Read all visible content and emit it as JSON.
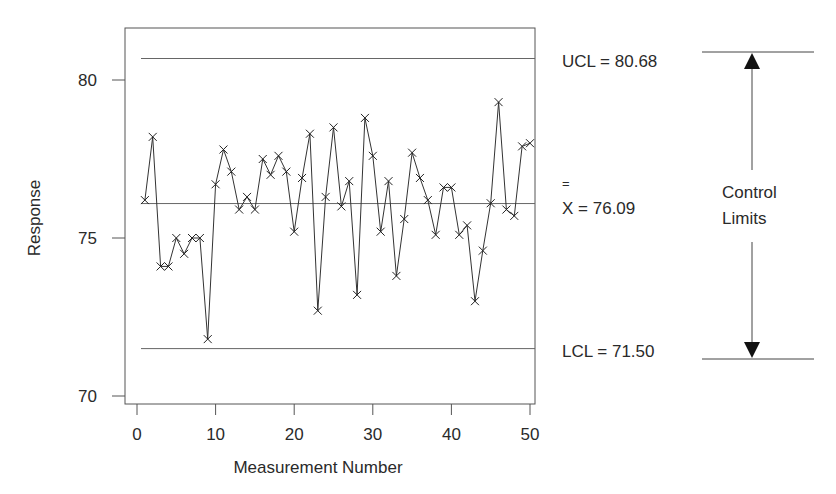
{
  "chart_data": {
    "type": "line",
    "title": "",
    "xlabel": "Measurement Number",
    "ylabel": "Response",
    "xlim": [
      0,
      50
    ],
    "ylim": [
      70,
      81.5
    ],
    "x_ticks": [
      0,
      10,
      20,
      30,
      40,
      50
    ],
    "y_ticks": [
      70,
      75,
      80
    ],
    "grid": false,
    "marker": "x",
    "x": [
      1,
      2,
      3,
      4,
      5,
      6,
      7,
      8,
      9,
      10,
      11,
      12,
      13,
      14,
      15,
      16,
      17,
      18,
      19,
      20,
      21,
      22,
      23,
      24,
      25,
      26,
      27,
      28,
      29,
      30,
      31,
      32,
      33,
      34,
      35,
      36,
      37,
      38,
      39,
      40,
      41,
      42,
      43,
      44,
      45,
      46,
      47,
      48,
      49,
      50
    ],
    "values": [
      76.2,
      78.2,
      74.1,
      74.1,
      75.0,
      74.5,
      75.0,
      75.0,
      71.8,
      76.7,
      77.8,
      77.1,
      75.9,
      76.3,
      75.9,
      77.5,
      77.0,
      77.6,
      77.1,
      75.2,
      76.9,
      78.3,
      72.7,
      76.3,
      78.5,
      76.0,
      76.8,
      73.2,
      78.8,
      77.6,
      75.2,
      76.8,
      73.8,
      75.6,
      77.7,
      76.9,
      76.2,
      75.1,
      76.6,
      76.6,
      75.1,
      75.4,
      73.0,
      74.6,
      76.1,
      79.3,
      75.9,
      75.7,
      77.9,
      78.0
    ],
    "reference_lines": [
      {
        "name": "UCL",
        "value": 80.68,
        "label": "UCL = 80.68"
      },
      {
        "name": "center",
        "value": 76.09,
        "label_symbol": "X",
        "label_overbar": "=",
        "label_rest": " = 76.09"
      },
      {
        "name": "LCL",
        "value": 71.5,
        "label": "LCL = 71.50"
      }
    ],
    "annotation": {
      "line1": "Control",
      "line2": "Limits"
    }
  },
  "labels": {
    "xlabel": "Measurement Number",
    "ylabel": "Response",
    "ucl": "UCL = 80.68",
    "mean_symbol": "X",
    "mean_overbar": "=",
    "mean_rest": " = 76.09",
    "lcl": "LCL = 71.50",
    "annot1": "Control",
    "annot2": "Limits"
  }
}
